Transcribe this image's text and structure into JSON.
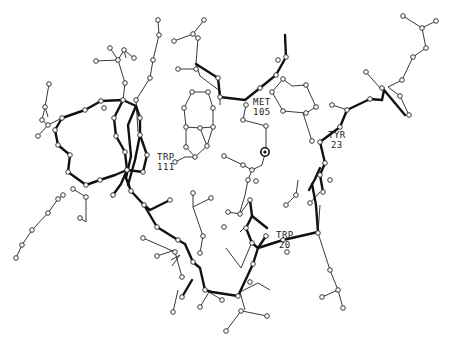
{
  "figure": {
    "type": "ball-and-stick protein active-site structure",
    "colors": {
      "background": "#ffffff",
      "ink": "#222222"
    }
  },
  "residue_labels": [
    {
      "id": "trp111",
      "name": "TRP",
      "number": "111",
      "x": 157,
      "y": 152
    },
    {
      "id": "met105",
      "name": "MET",
      "number": "105",
      "x": 253,
      "y": 97
    },
    {
      "id": "tyr23",
      "name": "TYR",
      "number": "23",
      "x": 328,
      "y": 130
    },
    {
      "id": "trp20",
      "name": "TRP",
      "number": "20",
      "x": 276,
      "y": 231
    }
  ],
  "metal_center": {
    "label": "",
    "x": 265,
    "y": 152
  }
}
